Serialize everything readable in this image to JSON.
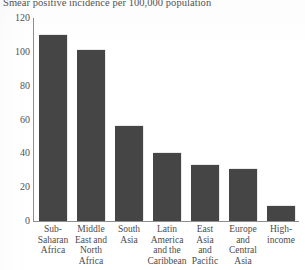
{
  "chart_data": {
    "type": "bar",
    "title": "Smear positive incidence per 100,000 population",
    "xlabel": "",
    "ylabel": "",
    "ylim": [
      0,
      120
    ],
    "yticks": [
      0,
      20,
      40,
      60,
      80,
      100,
      120
    ],
    "ytick_labels": [
      "0",
      "20",
      "40",
      "60",
      "80",
      "100",
      "120"
    ],
    "grid": false,
    "legend": "none",
    "bar_color": "#454545",
    "categories": [
      "Sub-Saharan Africa",
      "Middle East and North Africa",
      "South Asia",
      "Latin America and the Caribbean",
      "East Asia and Pacific",
      "Europe and Central Asia",
      "High-income"
    ],
    "category_lines": [
      [
        "Sub-",
        "Saharan",
        "Africa"
      ],
      [
        "Middle",
        "East and",
        "North",
        "Africa"
      ],
      [
        "South",
        "Asia"
      ],
      [
        "Latin",
        "America",
        "and the",
        "Caribbean"
      ],
      [
        "East",
        "Asia",
        "and",
        "Pacific"
      ],
      [
        "Europe",
        "and",
        "Central",
        "Asia"
      ],
      [
        "High-",
        "income"
      ]
    ],
    "values": [
      110,
      101,
      56,
      40,
      33,
      31,
      9
    ]
  }
}
